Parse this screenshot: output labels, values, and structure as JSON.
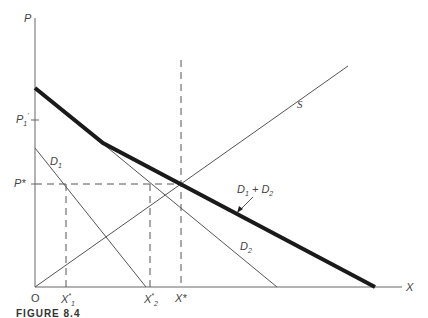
{
  "axes": {
    "y_label": "P",
    "x_label": "X",
    "origin_label": "O"
  },
  "price_labels": {
    "p1_prime": "P",
    "p1_prime_sub": "1",
    "p1_prime_sup": "'",
    "p_star": "P*"
  },
  "quantity_labels": {
    "x1_star": "X",
    "x1_star_sup": "*",
    "x1_star_sub": "1",
    "x2_star": "X",
    "x2_star_sup": "*",
    "x2_star_sub": "2",
    "x_star": "X*"
  },
  "curves": {
    "d1": {
      "label": "D",
      "sub": "1"
    },
    "d2": {
      "label": "D",
      "sub": "2"
    },
    "sum": {
      "label_a": "D",
      "sub_a": "1",
      "plus": " + ",
      "label_b": "D",
      "sub_b": "2"
    },
    "supply": {
      "label": "S"
    }
  },
  "caption": "FIGURE 8.4",
  "colors": {
    "line": "#555555",
    "thick": "#1a1a1a"
  }
}
